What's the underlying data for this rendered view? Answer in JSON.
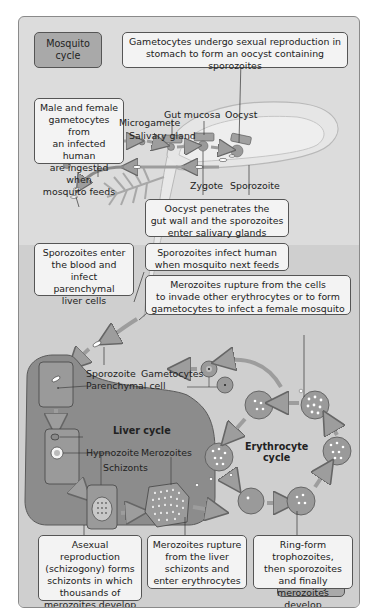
{
  "tags": {
    "mosquito_cycle": "Mosquito\ncycle",
    "human_cycle": "Human cycle"
  },
  "callouts": {
    "gametocytes_sexual": "Gametocytes undergo sexual reproduction in\nstomach to form an oocyst containing sporozoites",
    "male_female": "Male and female\ngametocytes from\nan infected human\nare ingested when\nmosquito feeds",
    "oocyst_penetrates": "Oocyst penetrates the\ngut wall and the sporozoites\nenter salivary glands",
    "sporozoites_infect": "Sporozoites infect human\nwhen mosquito next feeds",
    "sporozoites_enter": "Sporozoites enter\nthe blood and\ninfect parenchymal\nliver cells",
    "merozoites_rupture_cells": "Merozoites rupture from the cells\nto invade other erythrocytes or to form\ngametocytes to infect a female mosquito",
    "asexual_reproduction": "Asexual reproduction\n(schizogony) forms\nschizonts in which\nthousands of\nmerozoites develop",
    "merozoites_rupture_liver": "Merozoites rupture\nfrom the liver\nschizonts and\nenter erythrocytes",
    "ring_form": "Ring-form trophozoites,\nthen sporozoites\nand finally\nmerozoites develop"
  },
  "labels": {
    "gut_mucosa": "Gut mucosa",
    "oocyst": "Oocyst",
    "microgamete": "Microgamete",
    "salivary_gland": "Salivary gland",
    "zygote": "Zygote",
    "sporozoite_mosquito": "Sporozoite",
    "sporozoite_human": "Sporozoite",
    "gametocytes": "Gametocytes",
    "parenchymal_cell": "Parenchymal cell",
    "liver_cycle": "Liver cycle",
    "hypnozoite": "Hypnozoite",
    "merozoites": "Merozoites",
    "schizonts": "Schizonts",
    "erythrocyte_cycle": "Erythrocyte\ncycle"
  },
  "colors": {
    "background": "#dcdcdc",
    "human_zone": "#cfcfcf",
    "callout_fill": "#f3f3f3",
    "tag_fill": "#a9a9a9",
    "liver_fill": "#8c8c8c",
    "cell_fill": "#9a9a9a",
    "arrow": "#9d9d9d"
  }
}
